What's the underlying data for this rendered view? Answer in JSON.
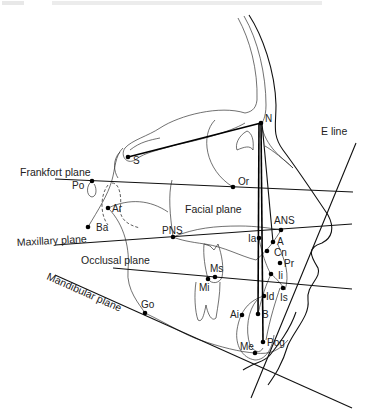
{
  "figure": {
    "header_text_faded": "",
    "plane_labels": {
      "frankfort": "Frankfort plane",
      "maxillary": "Maxillary plane",
      "occlusal": "Occlusal plane",
      "mandibular": "Mandibular plane",
      "facial": "Facial plane",
      "e_line": "E line"
    },
    "landmarks": [
      {
        "id": "N",
        "label": "N",
        "x": 261,
        "y": 123
      },
      {
        "id": "S",
        "label": "S",
        "x": 128,
        "y": 157
      },
      {
        "id": "Po",
        "label": "Po",
        "x": 92,
        "y": 181
      },
      {
        "id": "Or",
        "label": "Or",
        "x": 233,
        "y": 187
      },
      {
        "id": "Ar",
        "label": "Ar",
        "x": 108,
        "y": 208
      },
      {
        "id": "Ba",
        "label": "Ba",
        "x": 88,
        "y": 227
      },
      {
        "id": "PNS",
        "label": "PNS",
        "x": 173,
        "y": 237
      },
      {
        "id": "ANS",
        "label": "ANS",
        "x": 281,
        "y": 230
      },
      {
        "id": "Ia",
        "label": "Ia",
        "x": 259,
        "y": 238
      },
      {
        "id": "A",
        "label": "A",
        "x": 273,
        "y": 242
      },
      {
        "id": "Cn",
        "label": "Cn",
        "x": 267,
        "y": 251
      },
      {
        "id": "Pr",
        "label": "Pr",
        "x": 280,
        "y": 263
      },
      {
        "id": "Ii",
        "label": "Ii",
        "x": 271,
        "y": 274
      },
      {
        "id": "Is",
        "label": "Is",
        "x": 283,
        "y": 288
      },
      {
        "id": "Id",
        "label": "Id",
        "x": 264,
        "y": 296
      },
      {
        "id": "Ms",
        "label": "Ms",
        "x": 215,
        "y": 277
      },
      {
        "id": "Mi",
        "label": "Mi",
        "x": 208,
        "y": 279
      },
      {
        "id": "Ai",
        "label": "Ai",
        "x": 242,
        "y": 315
      },
      {
        "id": "B",
        "label": "B",
        "x": 258,
        "y": 314
      },
      {
        "id": "Rog",
        "label": "Pog",
        "x": 263,
        "y": 342
      },
      {
        "id": "Me",
        "label": "Me",
        "x": 255,
        "y": 353
      },
      {
        "id": "Go",
        "label": "Go",
        "x": 145,
        "y": 313
      }
    ]
  }
}
